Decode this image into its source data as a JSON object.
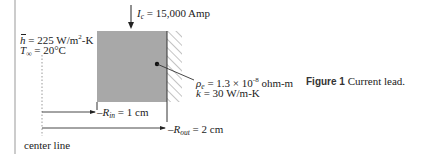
{
  "figure": {
    "caption_label": "Figure 1",
    "caption_text": "Current lead.",
    "current": {
      "symbol": "I",
      "subscript": "c",
      "value": "= 15,000 Amp"
    },
    "h_bar": {
      "symbol": "h",
      "value": "= 225 W/m",
      "exponent": "2",
      "unit_tail": "-K"
    },
    "t_inf": {
      "symbol": "T",
      "subscript": "∞",
      "value": "= 20°C"
    },
    "resistivity": {
      "symbol": "ρ",
      "subscript": "e",
      "value": "= 1.3 × 10",
      "exponent": "-8",
      "unit": " ohm-m"
    },
    "conductivity": {
      "symbol": "k",
      "value": "= 30 W/m-K"
    },
    "r_in": {
      "prefix": "–",
      "symbol": "R",
      "subscript": "in",
      "value": "= 1 cm"
    },
    "r_out": {
      "prefix": "–",
      "symbol": "R",
      "subscript": "out",
      "value": "= 2 cm"
    },
    "centerline_label": "center line",
    "colors": {
      "lead_fill": "#a8a8a8",
      "line": "#222222",
      "hatch": "#888888"
    }
  }
}
